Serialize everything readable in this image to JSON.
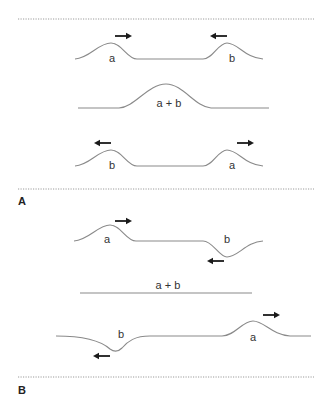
{
  "figure": {
    "colors": {
      "wave": "#8a8a8a",
      "arrow": "#1a1a1a",
      "separator": "#9a9a9a",
      "text": "#333333"
    },
    "panels": [
      {
        "label": "A",
        "case": "two upward pulses (constructive interference)",
        "rows": [
          {
            "stage": "before",
            "pulses": [
              {
                "label": "a",
                "shape": "crest",
                "direction": "right"
              },
              {
                "label": "b",
                "shape": "crest",
                "direction": "left"
              }
            ]
          },
          {
            "stage": "overlap",
            "label": "a + b",
            "shape": "larger crest"
          },
          {
            "stage": "after",
            "pulses": [
              {
                "label": "b",
                "shape": "crest",
                "direction": "left"
              },
              {
                "label": "a",
                "shape": "crest",
                "direction": "right"
              }
            ]
          }
        ]
      },
      {
        "label": "B",
        "case": "crest and trough (destructive interference)",
        "rows": [
          {
            "stage": "before",
            "pulses": [
              {
                "label": "a",
                "shape": "crest",
                "direction": "right"
              },
              {
                "label": "b",
                "shape": "trough",
                "direction": "left"
              }
            ]
          },
          {
            "stage": "overlap",
            "label": "a + b",
            "shape": "flat line"
          },
          {
            "stage": "after",
            "pulses": [
              {
                "label": "b",
                "shape": "trough",
                "direction": "left"
              },
              {
                "label": "a",
                "shape": "crest",
                "direction": "right"
              }
            ]
          }
        ]
      }
    ]
  },
  "labels": {
    "a": "a",
    "b": "b",
    "sum": "a + b",
    "panel_a": "A",
    "panel_b": "B"
  }
}
